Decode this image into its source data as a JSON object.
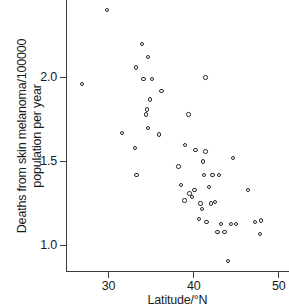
{
  "chart_data": {
    "type": "scatter",
    "title": "",
    "xlabel": "Latitude/°N",
    "ylabel": "Deaths from skin melanoma/100000 population per year",
    "ylabel_line1": "Deaths from skin melanoma/100000",
    "ylabel_line2": "population per year",
    "xlim": [
      25.0,
      51.2
    ],
    "ylim": [
      0.85,
      2.46
    ],
    "grid": false,
    "legend": null,
    "xticks": [
      30,
      40,
      50
    ],
    "xticklabels": [
      "30",
      "40",
      "50"
    ],
    "yticks": [
      1.0,
      1.5,
      2.0
    ],
    "yticklabels": [
      "1.0",
      "1.5",
      "2.0"
    ],
    "marker": "open-circle",
    "marker_color": "#2b2b2b",
    "axis_color": "#3a3a3a",
    "n_points": 49,
    "x": [
      29.8,
      26.9,
      33.2,
      33.9,
      34.6,
      31.6,
      34.1,
      35.1,
      36.2,
      33.1,
      34.5,
      34.9,
      34.4,
      34.5,
      35.9,
      39.4,
      33.3,
      41.4,
      38.2,
      39.0,
      40.2,
      41.1,
      41.4,
      42.2,
      44.6,
      38.5,
      39.5,
      39.8,
      40.1,
      41.2,
      41.8,
      43.0,
      46.4,
      40.8,
      41.0,
      42.0,
      42.5,
      43.2,
      38.9,
      40.6,
      41.5,
      42.8,
      44.4,
      45.0,
      47.2,
      47.9,
      43.6,
      47.8,
      44.0
    ],
    "y": [
      2.4,
      1.96,
      2.06,
      2.2,
      2.12,
      1.67,
      1.99,
      1.99,
      1.92,
      1.58,
      1.81,
      1.87,
      1.78,
      1.7,
      1.66,
      1.78,
      1.42,
      2.0,
      1.47,
      1.6,
      1.57,
      1.5,
      1.56,
      1.42,
      1.52,
      1.36,
      1.31,
      1.29,
      1.33,
      1.42,
      1.35,
      1.42,
      1.33,
      1.25,
      1.22,
      1.25,
      1.26,
      1.13,
      1.27,
      1.16,
      1.14,
      1.08,
      0.91,
      1.13,
      1.14,
      1.15,
      0.91,
      1.07,
      0.91
    ],
    "points": [
      {
        "lat": 29.8,
        "deaths": 2.4
      },
      {
        "lat": 26.9,
        "deaths": 1.96
      },
      {
        "lat": 33.2,
        "deaths": 2.06
      },
      {
        "lat": 33.9,
        "deaths": 2.2
      },
      {
        "lat": 34.6,
        "deaths": 2.12
      },
      {
        "lat": 31.6,
        "deaths": 1.67
      },
      {
        "lat": 34.1,
        "deaths": 1.99
      },
      {
        "lat": 35.1,
        "deaths": 1.99
      },
      {
        "lat": 36.2,
        "deaths": 1.92
      },
      {
        "lat": 33.1,
        "deaths": 1.58
      },
      {
        "lat": 34.5,
        "deaths": 1.81
      },
      {
        "lat": 34.9,
        "deaths": 1.87
      },
      {
        "lat": 34.4,
        "deaths": 1.78
      },
      {
        "lat": 34.6,
        "deaths": 1.7
      },
      {
        "lat": 35.9,
        "deaths": 1.66
      },
      {
        "lat": 39.4,
        "deaths": 1.78
      },
      {
        "lat": 33.3,
        "deaths": 1.42
      },
      {
        "lat": 41.4,
        "deaths": 2.0
      },
      {
        "lat": 38.2,
        "deaths": 1.47
      },
      {
        "lat": 39.0,
        "deaths": 1.6
      },
      {
        "lat": 40.2,
        "deaths": 1.57
      },
      {
        "lat": 41.1,
        "deaths": 1.5
      },
      {
        "lat": 41.4,
        "deaths": 1.56
      },
      {
        "lat": 42.2,
        "deaths": 1.42
      },
      {
        "lat": 44.6,
        "deaths": 1.52
      },
      {
        "lat": 38.5,
        "deaths": 1.36
      },
      {
        "lat": 39.5,
        "deaths": 1.31
      },
      {
        "lat": 39.8,
        "deaths": 1.29
      },
      {
        "lat": 40.1,
        "deaths": 1.33
      },
      {
        "lat": 41.2,
        "deaths": 1.42
      },
      {
        "lat": 41.8,
        "deaths": 1.35
      },
      {
        "lat": 43.0,
        "deaths": 1.42
      },
      {
        "lat": 46.4,
        "deaths": 1.33
      },
      {
        "lat": 40.8,
        "deaths": 1.25
      },
      {
        "lat": 41.0,
        "deaths": 1.22
      },
      {
        "lat": 42.0,
        "deaths": 1.25
      },
      {
        "lat": 42.5,
        "deaths": 1.26
      },
      {
        "lat": 43.2,
        "deaths": 1.13
      },
      {
        "lat": 38.9,
        "deaths": 1.27
      },
      {
        "lat": 40.6,
        "deaths": 1.16
      },
      {
        "lat": 41.5,
        "deaths": 1.14
      },
      {
        "lat": 42.8,
        "deaths": 1.08
      },
      {
        "lat": 44.4,
        "deaths": 1.13
      },
      {
        "lat": 45.0,
        "deaths": 1.13
      },
      {
        "lat": 47.2,
        "deaths": 1.14
      },
      {
        "lat": 47.9,
        "deaths": 1.15
      },
      {
        "lat": 43.6,
        "deaths": 1.08
      },
      {
        "lat": 47.8,
        "deaths": 1.07
      },
      {
        "lat": 44.0,
        "deaths": 0.91
      }
    ]
  }
}
